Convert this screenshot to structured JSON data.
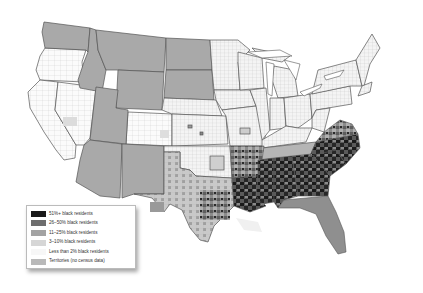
{
  "map": {
    "subject": "United States counties by share of black residents",
    "colors": {
      "background": "#ffffff",
      "county_border": "#b8b8b8",
      "state_border": "#555555",
      "no_data_fill": "#a9a9a9"
    }
  },
  "legend": {
    "items": [
      {
        "label": "51%+ black residents",
        "color": "#1a1a1a"
      },
      {
        "label": "26–50% black residents",
        "color": "#6e6e6e"
      },
      {
        "label": "11–25% black residents",
        "color": "#a3a3a3"
      },
      {
        "label": "3–10% black residents",
        "color": "#d6d6d6"
      },
      {
        "label": "Less than 2% black residents",
        "color": "#f7f7f7"
      },
      {
        "label": "Territories (no census data)",
        "color": "#b9b9b9"
      }
    ]
  }
}
